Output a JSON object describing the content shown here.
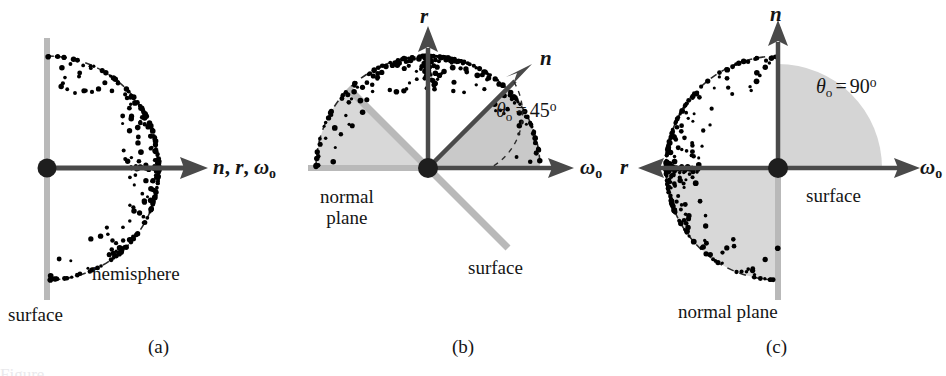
{
  "figure": {
    "background": "#ffffff",
    "colors": {
      "ink": "#1a1a1a",
      "surface_gray": "#b9b9b9",
      "wedge_gray": "#d8d8d8",
      "axis_gray": "#4a4a4a",
      "dot_black": "#000000"
    }
  },
  "panels": [
    {
      "id": "a",
      "caption": "(a)",
      "angle_label": null,
      "labels": {
        "axis": "n, r, ωo",
        "axis_parts": {
          "n": "n",
          "r": "r",
          "omega": "ω",
          "omega_sub": "o"
        },
        "hemisphere": "hemisphere",
        "surface": "surface"
      },
      "geometry": {
        "origin": [
          47,
          168
        ],
        "radius": 112,
        "surface_line": "vertical",
        "hemisphere_side": "right",
        "axes": [
          {
            "name": "n-r-omega",
            "direction": "right",
            "length": 160
          }
        ],
        "dot_cluster_direction": "right",
        "dot_count": 260
      }
    },
    {
      "id": "b",
      "caption": "(b)",
      "angle_label": {
        "symbol": "θ",
        "sub": "o",
        "eq": "=",
        "value": "45",
        "unit": "o"
      },
      "labels": {
        "r": "r",
        "n": "n",
        "omega": "ω",
        "omega_sub": "o",
        "normal_plane": "normal\nplane",
        "normal_plane_line1": "normal",
        "normal_plane_line2": "plane",
        "surface": "surface"
      },
      "geometry": {
        "origin": [
          128,
          168
        ],
        "radius": 112,
        "surface_line_angle_deg": 45,
        "axes": [
          {
            "name": "r",
            "direction": "up",
            "angle_deg": 90
          },
          {
            "name": "n",
            "direction": "upper-right",
            "angle_deg": 45
          },
          {
            "name": "omega-o",
            "direction": "right",
            "angle_deg": 0
          }
        ],
        "wedges": [
          {
            "name": "theta-wedge",
            "from_deg": 0,
            "to_deg": 45
          },
          {
            "name": "normal-plane-wedge",
            "from_deg": 135,
            "to_deg": 180
          }
        ],
        "dot_cluster_direction": "up",
        "dot_count": 300
      }
    },
    {
      "id": "c",
      "caption": "(c)",
      "angle_label": {
        "symbol": "θ",
        "sub": "o",
        "eq": "=",
        "value": "90",
        "unit": "o"
      },
      "labels": {
        "n": "n",
        "r": "r",
        "omega": "ω",
        "omega_sub": "o",
        "surface": "surface",
        "normal_plane": "normal plane"
      },
      "geometry": {
        "origin": [
          158,
          168
        ],
        "radius": 112,
        "surface_line": "vertical-below",
        "axes": [
          {
            "name": "n",
            "direction": "up",
            "angle_deg": 90
          },
          {
            "name": "r",
            "direction": "left",
            "angle_deg": 180
          },
          {
            "name": "omega-o",
            "direction": "right",
            "angle_deg": 0
          }
        ],
        "wedges": [
          {
            "name": "theta-wedge",
            "from_deg": 0,
            "to_deg": 90
          },
          {
            "name": "normal-plane-wedge",
            "from_deg": 180,
            "to_deg": 270
          }
        ],
        "dot_cluster_direction": "left",
        "dot_count": 300
      }
    }
  ],
  "figure_caption_clipped": "Figure"
}
